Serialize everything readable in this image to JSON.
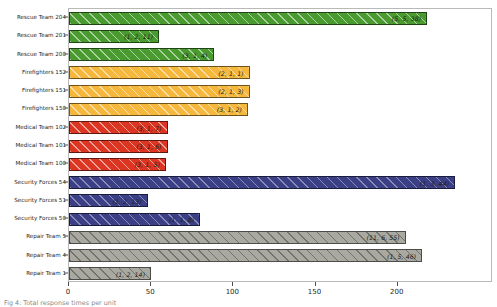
{
  "chart_data": {
    "type": "bar",
    "orientation": "horizontal",
    "title": "",
    "xlabel": "",
    "ylabel": "",
    "xlim": [
      0,
      258
    ],
    "xticks": [
      0,
      50,
      100,
      150,
      200
    ],
    "xtick_labels": [
      "0",
      "50",
      "100",
      "150",
      "200"
    ],
    "grid": false,
    "legend": false,
    "categories": [
      "Rescue Team 204",
      "Rescue Team 201",
      "Rescue Team 200",
      "Firefighters 152",
      "Firefighters 151",
      "Firefighters 150",
      "Medical Team 102",
      "Medical Team 101",
      "Medical Team 100",
      "Security Forces 54",
      "Security Forces 51",
      "Security Forces 50",
      "Repair Team 5",
      "Repair Team 4",
      "Repair Team 1"
    ],
    "values": [
      218,
      55,
      88,
      110,
      110,
      109,
      60,
      60,
      59,
      235,
      48,
      80,
      205,
      215,
      50
    ],
    "bar_labels": [
      "(5, 5, 38)",
      "(1, 2, 11)",
      "(3, 1, 4)",
      "(2, 1, 1)",
      "(2, 1, 3)",
      "(3, 1, 2)",
      "(3, 1, 7)",
      "(3, 1, 6)",
      "(3, 1, 5)",
      "(1, 3, 44)",
      "(1, 2, 13)",
      "(1, 1, 8)",
      "(11, 6, 55)",
      "(1, 5, 46)",
      "(1, 2, 14)"
    ],
    "colors": [
      "#4a9b2f",
      "#4a9b2f",
      "#4a9b2f",
      "#f5b83d",
      "#f5b83d",
      "#f5b83d",
      "#dc3522",
      "#dc3522",
      "#dc3522",
      "#3b3f86",
      "#3b3f86",
      "#3b3f86",
      "#a9a9a1",
      "#a9a9a1",
      "#a9a9a1"
    ],
    "group_colors": {
      "rescue": "#4a9b2f",
      "firefighters": "#f5b83d",
      "medical": "#dc3522",
      "security": "#3b3f86",
      "repair": "#a9a9a1"
    },
    "hatch": "/",
    "annotation_note": "Each bar is annotated with a tuple of three integers rendered in italic at the right inside edge of the bar."
  },
  "caption": {
    "text": "Fig 4: Total response times per unit"
  }
}
